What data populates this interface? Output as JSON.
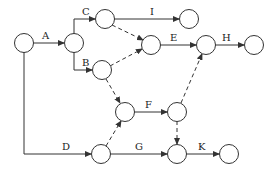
{
  "diagram": {
    "type": "activity-on-arrow network",
    "nodes": [
      {
        "id": "n1",
        "x": 24,
        "y": 43
      },
      {
        "id": "n2",
        "x": 74,
        "y": 43
      },
      {
        "id": "n3",
        "x": 105,
        "y": 19
      },
      {
        "id": "n4",
        "x": 189,
        "y": 19
      },
      {
        "id": "n5",
        "x": 151,
        "y": 45
      },
      {
        "id": "n6",
        "x": 206,
        "y": 45
      },
      {
        "id": "n7",
        "x": 254,
        "y": 45
      },
      {
        "id": "n8",
        "x": 102,
        "y": 70
      },
      {
        "id": "n9",
        "x": 125,
        "y": 112
      },
      {
        "id": "n10",
        "x": 177,
        "y": 112
      },
      {
        "id": "n11",
        "x": 101,
        "y": 154
      },
      {
        "id": "n12",
        "x": 177,
        "y": 154
      },
      {
        "id": "n13",
        "x": 229,
        "y": 154
      }
    ],
    "activities": [
      {
        "label": "A",
        "from": "n1",
        "to": "n2"
      },
      {
        "label": "C",
        "from": "n2",
        "to": "n3"
      },
      {
        "label": "B",
        "from": "n2",
        "to": "n8"
      },
      {
        "label": "I",
        "from": "n3",
        "to": "n4"
      },
      {
        "label": "E",
        "from": "n5",
        "to": "n6"
      },
      {
        "label": "H",
        "from": "n6",
        "to": "n7"
      },
      {
        "label": "F",
        "from": "n9",
        "to": "n10"
      },
      {
        "label": "D",
        "from": "n1",
        "to": "n11"
      },
      {
        "label": "G",
        "from": "n11",
        "to": "n12"
      },
      {
        "label": "K",
        "from": "n12",
        "to": "n13"
      }
    ],
    "dummies": [
      {
        "from": "n3",
        "to": "n5"
      },
      {
        "from": "n8",
        "to": "n5"
      },
      {
        "from": "n8",
        "to": "n9"
      },
      {
        "from": "n11",
        "to": "n9"
      },
      {
        "from": "n10",
        "to": "n6"
      },
      {
        "from": "n10",
        "to": "n12"
      }
    ],
    "labels": {
      "A": "A",
      "B": "B",
      "C": "C",
      "D": "D",
      "E": "E",
      "F": "F",
      "G": "G",
      "H": "H",
      "I": "I",
      "K": "K"
    }
  }
}
